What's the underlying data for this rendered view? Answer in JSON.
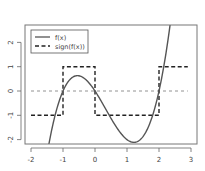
{
  "chart_data": {
    "type": "line",
    "title": "",
    "xlabel": "",
    "ylabel": "",
    "xlim": [
      -2.2,
      3.2
    ],
    "ylim": [
      -2.18,
      2.72
    ],
    "grid": false,
    "legend_position": "topleft",
    "x_ticks": [
      -2,
      -1,
      0,
      1,
      2,
      3
    ],
    "x_tick_labels": [
      "-2",
      "-1",
      "0",
      "1",
      "2",
      "3"
    ],
    "y_ticks": [
      -2,
      -1,
      0,
      1,
      2
    ],
    "y_tick_labels": [
      "-2",
      "-1",
      "0",
      "1",
      "2"
    ],
    "series": [
      {
        "name": "f(x)",
        "style": "solid",
        "function": "x^3 - x^2 - 2x",
        "x": [
          -1.43,
          -1.3,
          -1.2,
          -1.1,
          -1.0,
          -0.9,
          -0.8,
          -0.7,
          -0.6,
          -0.55,
          -0.5,
          -0.4,
          -0.3,
          -0.2,
          -0.1,
          0.0,
          0.1,
          0.2,
          0.3,
          0.4,
          0.5,
          0.6,
          0.7,
          0.8,
          0.9,
          1.0,
          1.1,
          1.22,
          1.3,
          1.4,
          1.5,
          1.6,
          1.7,
          1.8,
          1.9,
          2.0,
          2.1,
          2.2,
          2.3,
          2.36
        ],
        "y": [
          -2.0,
          -1.2,
          -0.77,
          -0.34,
          0.0,
          0.26,
          0.45,
          0.57,
          0.62,
          0.63,
          0.63,
          0.58,
          0.48,
          0.35,
          0.19,
          0.0,
          -0.21,
          -0.43,
          -0.66,
          -0.9,
          -1.13,
          -1.34,
          -1.55,
          -1.73,
          -1.88,
          -2.0,
          -2.08,
          -2.11,
          -2.09,
          -2.02,
          -1.88,
          -1.66,
          -1.38,
          -1.01,
          -0.56,
          0.0,
          0.65,
          1.41,
          2.29,
          2.72
        ]
      },
      {
        "name": "sign(f(x))",
        "style": "dashed",
        "segments": [
          {
            "x": [
              -2,
              -1
            ],
            "y": -1
          },
          {
            "x": [
              -1,
              0
            ],
            "y": 1
          },
          {
            "x": [
              0,
              2
            ],
            "y": -1
          },
          {
            "x": [
              2,
              2.9
            ],
            "y": 1
          }
        ]
      }
    ],
    "reference_lines": [
      {
        "orientation": "horizontal",
        "y": 0,
        "style": "dashed-fine",
        "x_range": [
          -2,
          2.9
        ]
      }
    ],
    "legend": [
      "f(x)",
      "sign(f(x))"
    ]
  },
  "legend": {
    "items": [
      {
        "label": "f(x)",
        "style": "solid"
      },
      {
        "label": "sign(f(x))",
        "style": "dashed"
      }
    ]
  },
  "axes": {
    "x_labels": [
      "-2",
      "-1",
      "0",
      "1",
      "2",
      "3"
    ],
    "y_labels": [
      "-2",
      "-1",
      "0",
      "1",
      "2"
    ]
  },
  "colors": {
    "curve": "#555555",
    "sign": "#222222",
    "axis": "#666666",
    "zero_line": "#777777"
  }
}
